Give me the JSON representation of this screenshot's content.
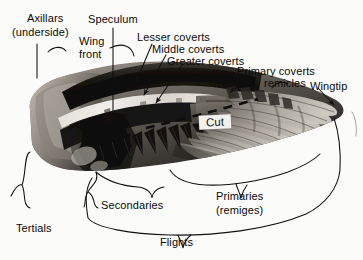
{
  "figure": {
    "background_color": "#fbfbfa",
    "text_color": "#0a0a0a",
    "leader_color": "#111111"
  },
  "labels": {
    "axillars": "Axillars",
    "axillars_sub": "(underside)",
    "speculum": "Speculum",
    "wing_front_1": "Wing",
    "wing_front_2": "front",
    "lesser_coverts": "Lesser  coverts",
    "middle_coverts": "Middle coverts",
    "greater_coverts": "Greater  coverts",
    "primary_coverts": "Primary coverts",
    "remicles": "remicles",
    "wingtip": "Wingtip",
    "cut": "Cut",
    "tertials": "Tertials",
    "secondaries": "Secondaries",
    "primaries": "Primaries",
    "primaries_sub": "(remiges)",
    "flights": "Flights"
  },
  "photo": {
    "description": "grayscale photograph of an outstretched bird wing",
    "features": [
      "dark brown-black coverts across the leading edge",
      "white speculum band crossing the mid wing",
      "pale grey secondaries with dark tips",
      "long banded primaries fanning to the right",
      "pale tertials and axillars at the wing base"
    ],
    "tone_dark": "#131211",
    "tone_mid": "#6e6a64",
    "tone_light": "#cfcac2",
    "tone_white": "#f4f2ee"
  },
  "annotations": {
    "cut_line_style": "dashed",
    "cut_line_color": "#111111",
    "brace_style": "curly",
    "arrow_style": "solid filled triangular head"
  }
}
